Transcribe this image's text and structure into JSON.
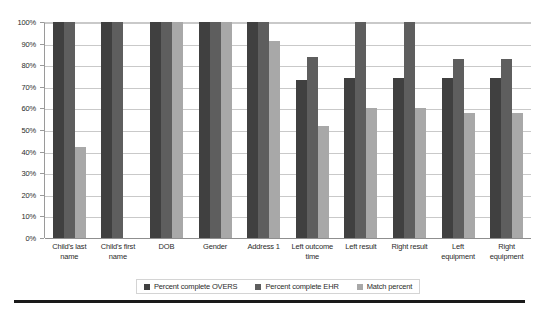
{
  "chart_data": {
    "type": "bar",
    "title": "",
    "xlabel": "",
    "ylabel": "",
    "ylim": [
      0,
      100
    ],
    "grid": true,
    "legend_position": "bottom",
    "categories": [
      "Child's last name",
      "Child's first name",
      "DOB",
      "Gender",
      "Address 1",
      "Left outcome time",
      "Left result",
      "Right result",
      "Left equipment",
      "Right equipment"
    ],
    "ytick_labels": [
      "100%",
      "90%",
      "80%",
      "70%",
      "60%",
      "50%",
      "40%",
      "30%",
      "20%",
      "10%",
      "0%"
    ],
    "ytick_values": [
      100,
      90,
      80,
      70,
      60,
      50,
      40,
      30,
      20,
      10,
      0
    ],
    "series": [
      {
        "name": "Percent complete OVERS",
        "color": "#404040",
        "values": [
          100,
          100,
          100,
          100,
          100,
          73,
          74,
          74,
          74,
          74
        ]
      },
      {
        "name": "Percent complete EHR",
        "color": "#5e5e5e",
        "values": [
          100,
          100,
          100,
          100,
          100,
          84,
          100,
          100,
          83,
          83
        ]
      },
      {
        "name": "Match percent",
        "color": "#a8a8a8",
        "values": [
          42,
          0,
          100,
          100,
          91,
          52,
          60,
          60,
          58,
          58
        ]
      }
    ]
  },
  "legend": {
    "items": [
      {
        "label": "Percent complete OVERS",
        "swatch": "#404040"
      },
      {
        "label": "Percent complete EHR",
        "swatch": "#5e5e5e"
      },
      {
        "label": "Match percent",
        "swatch": "#a8a8a8"
      }
    ]
  }
}
